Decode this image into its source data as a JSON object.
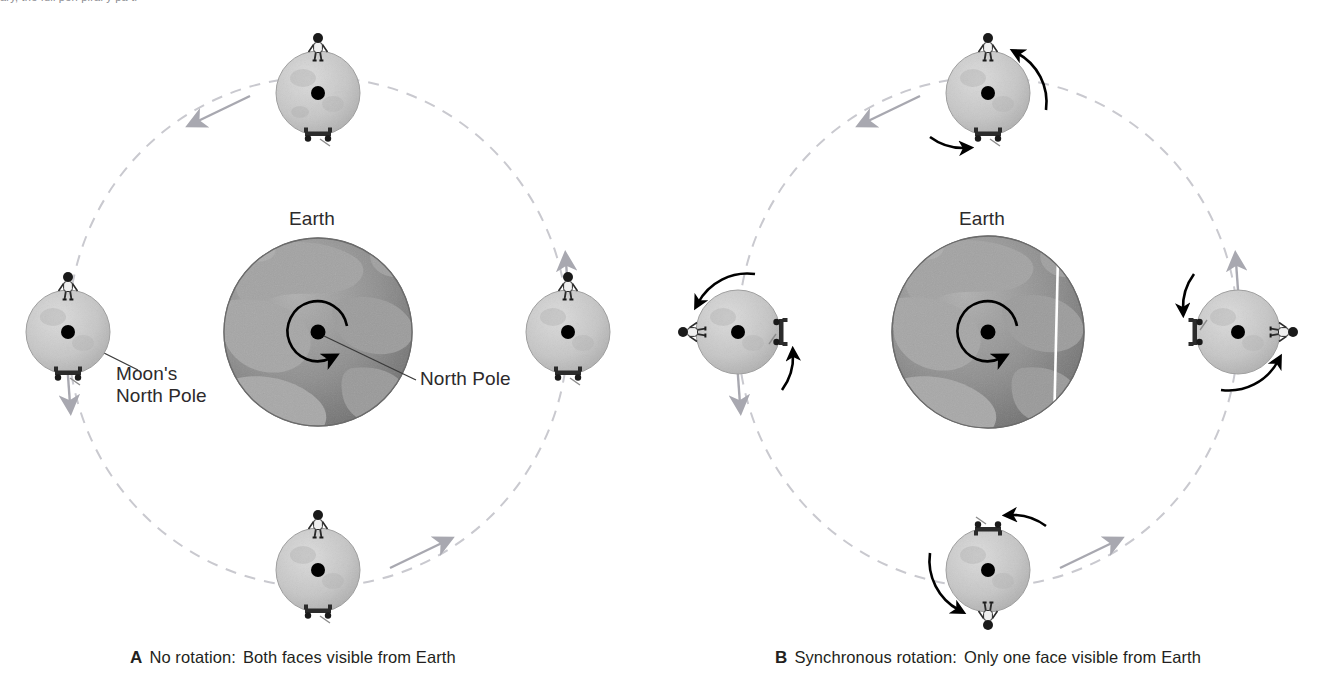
{
  "figure": {
    "clipped_header_text": "ary, the full  peri  piral y pa  ti",
    "background_color": "#ffffff",
    "ink_color": "#231f20"
  },
  "colors": {
    "orbit_path": "#c9c9cf",
    "orbit_arrow": "#a8a8b0",
    "earth_land": "#9a9a9a",
    "earth_ocean": "#7b7b7b",
    "earth_outline": "#6f6f6f",
    "moon_body": "#c3c3c3",
    "moon_shadow": "#a9a9a9",
    "pole_dot": "#000000",
    "rotation_arrow": "#000000",
    "leader_line": "#3a3a3a",
    "meridian_line": "#ffffff"
  },
  "panels": [
    {
      "id": "A",
      "letter": "A",
      "caption_main": "No rotation:",
      "caption_detail": "Both faces visible from Earth",
      "center_body": {
        "name": "Earth",
        "label": "Earth",
        "rotation": "counterclockwise",
        "has_meridian_line": false
      },
      "labels": [
        {
          "name": "moons-north-pole",
          "text_line_1": "Moon's",
          "text_line_2": "North Pole"
        },
        {
          "name": "earth-north-pole",
          "text_line_1": "North Pole",
          "text_line_2": ""
        }
      ],
      "moons": [
        {
          "position": "top",
          "astronaut_at": "top",
          "rover_at": "bottom",
          "rotation_arrows": false
        },
        {
          "position": "right",
          "astronaut_at": "top",
          "rover_at": "bottom",
          "rotation_arrows": false
        },
        {
          "position": "bottom",
          "astronaut_at": "top",
          "rover_at": "bottom",
          "rotation_arrows": false
        },
        {
          "position": "left",
          "astronaut_at": "top",
          "rover_at": "bottom",
          "rotation_arrows": false
        }
      ],
      "orbit_direction": "counterclockwise"
    },
    {
      "id": "B",
      "letter": "B",
      "caption_main": "Synchronous rotation:",
      "caption_detail": "Only one face visible from Earth",
      "center_body": {
        "name": "Earth",
        "label": "Earth",
        "rotation": "counterclockwise",
        "has_meridian_line": true
      },
      "labels": [],
      "moons": [
        {
          "position": "top",
          "astronaut_at": "top",
          "rover_at": "bottom",
          "rotation_arrows": true
        },
        {
          "position": "right",
          "astronaut_at": "right",
          "rover_at": "left",
          "rotation_arrows": true
        },
        {
          "position": "bottom",
          "astronaut_at": "bottom",
          "rover_at": "top",
          "rotation_arrows": true
        },
        {
          "position": "left",
          "astronaut_at": "left",
          "rover_at": "right",
          "rotation_arrows": true
        }
      ],
      "orbit_direction": "counterclockwise"
    }
  ]
}
